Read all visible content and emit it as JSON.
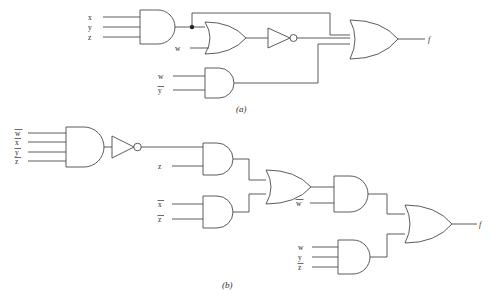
{
  "figure": {
    "background": "#ffffff",
    "ink_color": "#4a4a4a",
    "text_color": "#2b2b2b",
    "captions": {
      "a": "(a)",
      "b": "(b)"
    }
  },
  "circuit_a": {
    "caption": "(a)",
    "output_label": "f",
    "gates": [
      {
        "id": "a_and1",
        "type": "AND",
        "inputs": [
          "x",
          "y",
          "z"
        ],
        "input_labels": [
          {
            "text": "x",
            "overbar": false
          },
          {
            "text": "y",
            "overbar": false
          },
          {
            "text": "z",
            "overbar": false
          }
        ]
      },
      {
        "id": "a_or1",
        "type": "OR",
        "inputs": [
          "a_and1",
          "w"
        ],
        "input_labels": [
          {
            "text": "w",
            "overbar": false
          }
        ]
      },
      {
        "id": "a_not1",
        "type": "NOT",
        "inputs": [
          "a_or1"
        ],
        "input_labels": []
      },
      {
        "id": "a_and2",
        "type": "AND",
        "inputs": [
          "w",
          "y"
        ],
        "input_labels": [
          {
            "text": "w",
            "overbar": false
          },
          {
            "text": "y",
            "overbar": true
          }
        ]
      },
      {
        "id": "a_or2",
        "type": "OR",
        "inputs": [
          "a_and1",
          "a_not1",
          "a_and2"
        ],
        "input_labels": [],
        "output": "f"
      }
    ]
  },
  "circuit_b": {
    "caption": "(b)",
    "output_label": "f",
    "gates": [
      {
        "id": "b_and1",
        "type": "AND",
        "inputs": [
          "w",
          "x",
          "y",
          "z"
        ],
        "input_labels": [
          {
            "text": "w",
            "overbar": true
          },
          {
            "text": "x",
            "overbar": true
          },
          {
            "text": "y",
            "overbar": true
          },
          {
            "text": "z",
            "overbar": true
          }
        ]
      },
      {
        "id": "b_not1",
        "type": "NOT",
        "inputs": [
          "b_and1"
        ],
        "input_labels": []
      },
      {
        "id": "b_and2",
        "type": "AND",
        "inputs": [
          "b_not1",
          "z"
        ],
        "input_labels": [
          {
            "text": "z",
            "overbar": false
          }
        ]
      },
      {
        "id": "b_and3",
        "type": "AND",
        "inputs": [
          "x",
          "z"
        ],
        "input_labels": [
          {
            "text": "x",
            "overbar": true
          },
          {
            "text": "z",
            "overbar": true
          }
        ]
      },
      {
        "id": "b_or1",
        "type": "OR",
        "inputs": [
          "b_and2",
          "b_and3"
        ],
        "input_labels": []
      },
      {
        "id": "b_and4",
        "type": "AND",
        "inputs": [
          "b_or1",
          "w"
        ],
        "input_labels": [
          {
            "text": "w",
            "overbar": true
          }
        ]
      },
      {
        "id": "b_and5",
        "type": "AND",
        "inputs": [
          "w",
          "y",
          "z"
        ],
        "input_labels": [
          {
            "text": "w",
            "overbar": false
          },
          {
            "text": "y",
            "overbar": false
          },
          {
            "text": "z",
            "overbar": true
          }
        ]
      },
      {
        "id": "b_or2",
        "type": "OR",
        "inputs": [
          "b_and4",
          "b_and5"
        ],
        "input_labels": [],
        "output": "f"
      }
    ]
  },
  "labels": {
    "a_and1_in1": "x",
    "a_and1_in2": "y",
    "a_and1_in3": "z",
    "a_or1_in2": "w",
    "a_and2_in1": "w",
    "a_and2_in2": "y",
    "a_out": "f",
    "b_and1_in1": "w",
    "b_and1_in2": "x",
    "b_and1_in3": "y",
    "b_and1_in4": "z",
    "b_and2_in2": "z",
    "b_and3_in1": "x",
    "b_and3_in2": "z",
    "b_and4_in2": "w",
    "b_and5_in1": "w",
    "b_and5_in2": "y",
    "b_and5_in3": "z",
    "b_out": "f"
  }
}
